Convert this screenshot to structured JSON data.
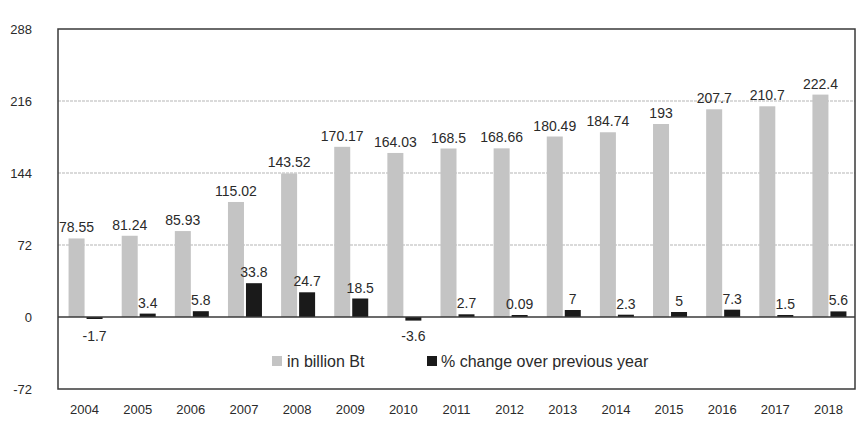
{
  "chart_data": {
    "type": "bar",
    "title": "",
    "xlabel": "",
    "ylabel": "",
    "ylim": [
      -72,
      288
    ],
    "yticks": [
      -72,
      0,
      72,
      144,
      216,
      288
    ],
    "grid": true,
    "legend_position": "bottom-center",
    "categories": [
      "2004",
      "2005",
      "2006",
      "2007",
      "2008",
      "2009",
      "2010",
      "2011",
      "2012",
      "2013",
      "2014",
      "2015",
      "2016",
      "2017",
      "2018"
    ],
    "series": [
      {
        "name": "in billion Bt",
        "color": "#c4c4c4",
        "values": [
          78.55,
          81.24,
          85.93,
          115.02,
          143.52,
          170.17,
          164.03,
          168.5,
          168.66,
          180.49,
          184.74,
          193,
          207.7,
          210.7,
          222.4
        ],
        "labels": [
          "78.55",
          "81.24",
          "85.93",
          "115.02",
          "143.52",
          "170.17",
          "164.03",
          "168.5",
          "168.66",
          "180.49",
          "184.74",
          "193",
          "207.7",
          "210.7",
          "222.4"
        ]
      },
      {
        "name": "% change over previous year",
        "color": "#1a1a1a",
        "values": [
          -1.7,
          3.4,
          5.8,
          33.8,
          24.7,
          18.5,
          -3.6,
          2.7,
          0.09,
          7,
          2.3,
          5,
          7.3,
          1.5,
          5.6
        ],
        "labels": [
          "-1.7",
          "3.4",
          "5.8",
          "33.8",
          "24.7",
          "18.5",
          "-3.6",
          "2.7",
          "0.09",
          "7",
          "2.3",
          "5",
          "7.3",
          "1.5",
          "5.6"
        ]
      }
    ]
  }
}
